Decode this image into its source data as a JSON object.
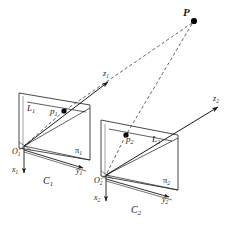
{
  "figure": {
    "background_color": "#ffffff",
    "stroke_color": "#1a1a1a",
    "dash_color": "#333333",
    "point_fill": "#000000",
    "width": 237,
    "height": 226
  },
  "labels": {
    "world_point": "P",
    "cam1": {
      "line": "L",
      "line_sub": "1",
      "image_point": "p",
      "image_point_sub": "1",
      "origin": "O",
      "origin_sub": "1",
      "axis_x": "x",
      "axis_x_sub": "1",
      "axis_y": "y",
      "axis_y_sub": "1",
      "axis_z": "z",
      "axis_z_sub": "1",
      "plane": "π",
      "plane_sub": "1",
      "camera": "C",
      "camera_sub": "1"
    },
    "cam2": {
      "line": "L",
      "line_sub": "2",
      "image_point": "p",
      "image_point_sub": "2",
      "origin": "O",
      "origin_sub": "2",
      "axis_x": "x",
      "axis_x_sub": "2",
      "axis_y": "y",
      "axis_y_sub": "2",
      "axis_z": "z",
      "axis_z_sub": "2",
      "plane": "π",
      "plane_sub": "2",
      "camera": "C",
      "camera_sub": "2"
    }
  },
  "geometry": {
    "world_point_xy": [
      194,
      21
    ],
    "cam1": {
      "plane_quad": [
        [
          19,
          93
        ],
        [
          90,
          105
        ],
        [
          90,
          160
        ],
        [
          19,
          148
        ]
      ],
      "origin_xy": [
        24,
        146
      ],
      "image_point_xy": [
        64,
        111
      ],
      "line_from": [
        27,
        102
      ],
      "line_to": [
        82,
        113
      ],
      "axis_x_to": [
        24,
        176
      ],
      "axis_y_to": [
        86,
        170
      ],
      "axis_z_to": [
        112,
        79
      ]
    },
    "cam2": {
      "plane_quad": [
        [
          101,
          120
        ],
        [
          178,
          135
        ],
        [
          178,
          190
        ],
        [
          101,
          176
        ]
      ],
      "origin_xy": [
        106,
        175
      ],
      "image_point_xy": [
        126,
        135
      ],
      "line_from": [
        109,
        129
      ],
      "line_to": [
        168,
        142
      ],
      "axis_x_to": [
        106,
        204
      ],
      "axis_y_to": [
        172,
        199
      ],
      "axis_z_to": [
        222,
        104
      ]
    }
  }
}
